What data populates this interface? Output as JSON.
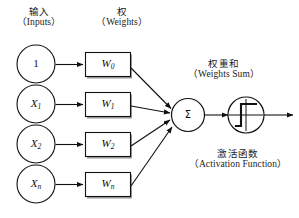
{
  "figure": {
    "title_cn": "",
    "background": "#ffffff",
    "stroke": "#111111"
  },
  "labels": {
    "inputs": {
      "cn": "输入",
      "en": "（Inputs）"
    },
    "weights": {
      "cn": "权",
      "en": "（Weights）"
    },
    "weights_sum": {
      "cn": "权重和",
      "en": "（Weights Sum）"
    },
    "activation": {
      "cn": "激活函数",
      "en": "（Activation Function）"
    }
  },
  "inputs": [
    {
      "base": "1",
      "sub": ""
    },
    {
      "base": "X",
      "sub": "1"
    },
    {
      "base": "X",
      "sub": "2"
    },
    {
      "base": "X",
      "sub": "n"
    }
  ],
  "weights": [
    {
      "base": "W",
      "sub": "0"
    },
    {
      "base": "W",
      "sub": "1"
    },
    {
      "base": "W",
      "sub": "2"
    },
    {
      "base": "W",
      "sub": "n"
    }
  ],
  "summation": {
    "symbol": "Σ"
  },
  "activation_node": {
    "symbol": "step-function"
  },
  "output": {
    "label": ""
  }
}
